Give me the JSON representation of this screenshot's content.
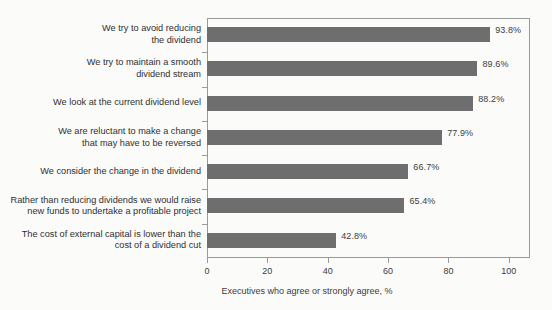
{
  "chart_data": {
    "type": "bar",
    "orientation": "horizontal",
    "title": "",
    "subtitle": "",
    "xlabel": "Executives who agree or strongly agree, %",
    "ylabel": "",
    "xlim": [
      0,
      107
    ],
    "xticks": [
      0,
      20,
      40,
      60,
      80,
      100
    ],
    "xtick_labels": [
      "0",
      "20",
      "40",
      "60",
      "80",
      "100"
    ],
    "grid": false,
    "legend": false,
    "bar_color": "#6e6e6e",
    "frame_color": "#9a9a9a",
    "background": "#fbfbfa",
    "value_suffix": "%",
    "categories": [
      "We try to avoid reducing\nthe dividend",
      "We try to maintain a smooth\ndividend stream",
      "We look at the current dividend level",
      "We are reluctant to make a change\nthat may have to be reversed",
      "We consider the change in the dividend",
      "Rather than reducing dividends we would raise\nnew funds to undertake a profitable project",
      "The cost of external capital is lower than the\ncost of a dividend cut"
    ],
    "values": [
      93.8,
      89.6,
      88.2,
      77.9,
      66.7,
      65.4,
      42.8
    ],
    "value_labels": [
      "93.8%",
      "89.6%",
      "88.2%",
      "77.9%",
      "66.7%",
      "65.4%",
      "42.8%"
    ]
  }
}
